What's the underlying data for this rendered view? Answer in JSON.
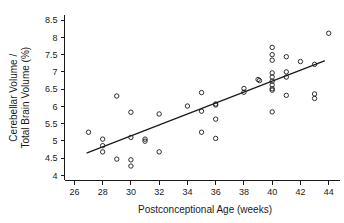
{
  "chart_data": {
    "type": "scatter",
    "title": "",
    "xlabel": "Postconceptional Age (weeks)",
    "ylabel": "Cerebellar Volume /\nTotal Brain Volume (%)",
    "ylabel_line1": "Cerebellar Volume /",
    "ylabel_line2": "Total Brain Volume (%)",
    "xlim": [
      25.3,
      44.8
    ],
    "ylim": [
      3.85,
      8.65
    ],
    "xticks": [
      26,
      28,
      30,
      32,
      34,
      36,
      38,
      40,
      42,
      44
    ],
    "xtick_labels": [
      "26",
      "28",
      "30",
      "32",
      "34",
      "36",
      "38",
      "40",
      "42",
      "44"
    ],
    "yticks": [
      4,
      4.5,
      5,
      5.5,
      6,
      6.5,
      7,
      7.5,
      8,
      8.5
    ],
    "ytick_labels": [
      "4",
      "4.5",
      "5",
      "5.5",
      "6",
      "6.5",
      "7",
      "7.5",
      "8",
      "8.5"
    ],
    "grid": false,
    "legend": null,
    "marker": "open-circle",
    "marker_color": "#1a1a1a",
    "series": [
      {
        "name": "Subjects",
        "x": [
          27.0,
          28.0,
          28.0,
          28.0,
          29.0,
          29.0,
          30.0,
          30.0,
          30.0,
          30.0,
          31.0,
          31.0,
          32.0,
          32.0,
          34.0,
          35.0,
          35.0,
          35.0,
          36.0,
          36.0,
          36.0,
          36.0,
          38.0,
          38.0,
          39.0,
          39.1,
          40.0,
          40.0,
          40.0,
          40.0,
          40.0,
          40.0,
          40.0,
          40.0,
          40.0,
          40.0,
          41.0,
          41.0,
          41.0,
          41.0,
          42.0,
          43.0,
          43.0,
          43.0,
          44.0
        ],
        "y": [
          5.25,
          5.05,
          4.86,
          4.68,
          6.3,
          4.47,
          5.83,
          5.1,
          4.45,
          4.27,
          5.05,
          4.99,
          5.78,
          4.68,
          6.01,
          6.4,
          5.86,
          5.25,
          6.07,
          6.04,
          5.63,
          5.07,
          6.52,
          6.41,
          6.78,
          6.75,
          7.71,
          7.5,
          7.34,
          6.97,
          6.85,
          6.73,
          6.62,
          6.51,
          6.47,
          5.84,
          7.44,
          7.0,
          6.85,
          6.32,
          7.3,
          7.22,
          6.36,
          6.23,
          8.12
        ]
      }
    ],
    "fit_line": {
      "name": "Linear regression",
      "x0": 26.9,
      "y0": 4.65,
      "x1": 43.7,
      "y1": 7.32
    }
  },
  "figure": {
    "background_color": "#ffffff",
    "foreground_color": "#1a1a1a"
  }
}
